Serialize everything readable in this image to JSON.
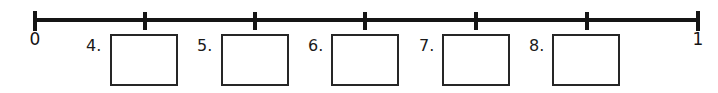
{
  "worksheet": {
    "background_color": "#ffffff",
    "ink_color": "#151515"
  },
  "numberline": {
    "name": "number-line",
    "start_label": "0",
    "end_label": "1",
    "axis": {
      "x_start": 35,
      "x_end": 700,
      "y": 20,
      "thickness": 4
    },
    "tick_count": 7,
    "tick_positions_px": [
      35,
      145,
      255,
      365,
      476,
      587,
      698
    ],
    "tick_labels": [
      "0",
      "",
      "",
      "",
      "",
      "",
      "1"
    ],
    "line_color": "#151515"
  },
  "answers": {
    "name": "answer-boxes",
    "items": [
      {
        "number": "4.",
        "label_x": 86,
        "box_x": 110,
        "box_width": 68,
        "box_height": 52,
        "value": ""
      },
      {
        "number": "5.",
        "label_x": 197,
        "box_x": 221,
        "box_width": 68,
        "box_height": 52,
        "value": ""
      },
      {
        "number": "6.",
        "label_x": 308,
        "box_x": 331,
        "box_width": 68,
        "box_height": 52,
        "value": ""
      },
      {
        "number": "7.",
        "label_x": 419,
        "box_x": 442,
        "box_width": 68,
        "box_height": 52,
        "value": ""
      },
      {
        "number": "8.",
        "label_x": 529,
        "box_x": 552,
        "box_width": 68,
        "box_height": 52,
        "value": ""
      }
    ],
    "box_border_color": "#262626",
    "box_fill_color": "#ffffff"
  }
}
